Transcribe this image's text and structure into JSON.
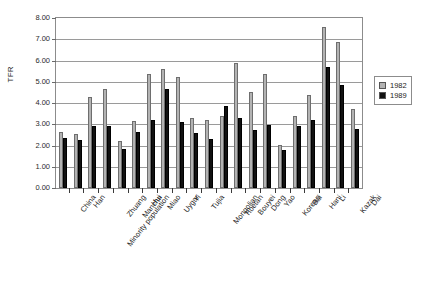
{
  "chart_data": {
    "type": "bar",
    "title": "",
    "subtitle": "",
    "xlabel": "",
    "ylabel": "TFR",
    "ylim": [
      0.0,
      8.0
    ],
    "ytick_step": 1.0,
    "ytick_labels": [
      "8.00",
      "7.00",
      "6.00",
      "5.00",
      "4.00",
      "3.00",
      "2.00",
      "1.00",
      "0.00"
    ],
    "ytick_values": [
      8.0,
      7.0,
      6.0,
      5.0,
      4.0,
      3.0,
      2.0,
      1.0,
      0.0
    ],
    "grid": true,
    "legend_position": "right",
    "categories": [
      "China",
      "Han",
      "Minority population",
      "Zhuang",
      "Manchu",
      "Hui",
      "Miao",
      "Uygur",
      "Yi",
      "Tujia",
      "Mongolian",
      "Tibetan",
      "Bouyei",
      "Dong",
      "Yao",
      "Korean",
      "Bai",
      "Hani",
      "Li",
      "Kazak",
      "Dai"
    ],
    "series": [
      {
        "name": "1982",
        "color": "#b3b3b3",
        "values": [
          2.63,
          2.55,
          4.27,
          4.68,
          2.22,
          3.14,
          5.35,
          5.61,
          5.24,
          3.29,
          3.18,
          3.4,
          5.88,
          4.5,
          5.37,
          2.03,
          3.4,
          4.36,
          7.6,
          6.89,
          3.71
        ]
      },
      {
        "name": "1989",
        "color": "#111111",
        "values": [
          2.35,
          2.28,
          2.94,
          2.94,
          1.85,
          2.62,
          3.19,
          4.68,
          3.11,
          2.58,
          2.33,
          3.87,
          3.31,
          2.72,
          2.98,
          1.8,
          2.92,
          3.22,
          5.71,
          4.83,
          2.76
        ]
      }
    ]
  },
  "legend": {
    "entries": [
      {
        "label": "1982",
        "key": "s1982"
      },
      {
        "label": "1989",
        "key": "s1989"
      }
    ]
  }
}
